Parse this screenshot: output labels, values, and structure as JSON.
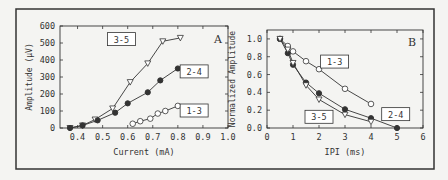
{
  "figure": {
    "background": "#f4f4f2",
    "frame_color": "#333333",
    "line_color": "#333333"
  },
  "chart_data": [
    {
      "type": "line",
      "panel_label": "A",
      "title": "",
      "xlabel": "Current (mA)",
      "ylabel": "Amplitude (μV)",
      "xlim": [
        0.33,
        1.0
      ],
      "ylim": [
        0,
        600
      ],
      "xticks": [
        "0.4",
        "0.5",
        "0.6",
        "0.7",
        "0.8",
        "0.9",
        "1.0"
      ],
      "xtick_values": [
        0.4,
        0.5,
        0.6,
        0.7,
        0.8,
        0.9,
        1.0
      ],
      "yticks": [
        "0",
        "100",
        "200",
        "300",
        "400",
        "500",
        "600"
      ],
      "ytick_values": [
        0,
        100,
        200,
        300,
        400,
        500,
        600
      ],
      "grid": false,
      "legend": "inline boxed labels",
      "series": [
        {
          "name": "3-5",
          "marker": "open-triangle-down",
          "x": [
            0.37,
            0.42,
            0.47,
            0.54,
            0.61,
            0.68,
            0.74,
            0.81
          ],
          "y": [
            0,
            15,
            50,
            115,
            270,
            380,
            510,
            530
          ],
          "label_pos": [
            0.575,
            520
          ]
        },
        {
          "name": "2-4",
          "marker": "filled-circle",
          "x": [
            0.37,
            0.42,
            0.48,
            0.55,
            0.6,
            0.68,
            0.73,
            0.8
          ],
          "y": [
            0,
            15,
            45,
            90,
            145,
            210,
            280,
            350
          ],
          "label_pos": [
            0.865,
            330
          ]
        },
        {
          "name": "1-3",
          "marker": "open-circle",
          "x": [
            0.62,
            0.65,
            0.69,
            0.72,
            0.75,
            0.8
          ],
          "y": [
            25,
            40,
            55,
            85,
            100,
            130
          ],
          "label_pos": [
            0.865,
            100
          ]
        }
      ]
    },
    {
      "type": "line",
      "panel_label": "B",
      "title": "",
      "xlabel": "IPI (ms)",
      "ylabel": "Normalized Amplitude",
      "xlim": [
        0,
        6
      ],
      "ylim": [
        0,
        1.1
      ],
      "xticks": [
        "0",
        "1",
        "2",
        "3",
        "4",
        "5",
        "6"
      ],
      "xtick_values": [
        0,
        1,
        2,
        3,
        4,
        5,
        6
      ],
      "yticks": [
        "0.0",
        "0.2",
        "0.4",
        "0.6",
        "0.8",
        "1.0"
      ],
      "ytick_values": [
        0,
        0.2,
        0.4,
        0.6,
        0.8,
        1.0
      ],
      "grid": false,
      "legend": "inline boxed labels",
      "series": [
        {
          "name": "1-3",
          "marker": "open-circle",
          "x": [
            0.5,
            0.8,
            1.0,
            1.5,
            2.0,
            3.0,
            4.0
          ],
          "y": [
            1.0,
            0.92,
            0.86,
            0.75,
            0.66,
            0.44,
            0.27
          ],
          "label_pos": [
            2.6,
            0.74
          ]
        },
        {
          "name": "2-4",
          "marker": "filled-circle",
          "x": [
            0.5,
            0.8,
            1.0,
            1.5,
            2.0,
            3.0,
            4.0,
            5.0
          ],
          "y": [
            1.0,
            0.84,
            0.71,
            0.51,
            0.39,
            0.21,
            0.11,
            0.0
          ],
          "label_pos": [
            4.95,
            0.15
          ]
        },
        {
          "name": "3-5",
          "marker": "open-triangle-down",
          "x": [
            0.5,
            0.8,
            1.0,
            1.5,
            2.0,
            3.0,
            4.0
          ],
          "y": [
            1.0,
            0.88,
            0.73,
            0.48,
            0.32,
            0.15,
            0.07
          ],
          "label_pos": [
            2.0,
            0.12
          ]
        }
      ]
    }
  ]
}
